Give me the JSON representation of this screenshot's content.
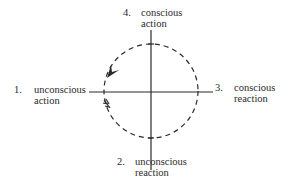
{
  "diagram": {
    "quadrants": [
      {
        "number": "1.",
        "line1": "unconscious",
        "line2": "action",
        "position": "left"
      },
      {
        "number": "2.",
        "line1": "unconscious",
        "line2": "reaction",
        "position": "bottom"
      },
      {
        "number": "3.",
        "line1": "conscious",
        "line2": "reaction",
        "position": "right"
      },
      {
        "number": "4.",
        "line1": "conscious",
        "line2": "action",
        "position": "top"
      }
    ],
    "circle": {
      "style": "dashed",
      "direction": "counterclockwise"
    },
    "colors": {
      "ink": "#2a2a2a",
      "background": "#ffffff"
    }
  }
}
